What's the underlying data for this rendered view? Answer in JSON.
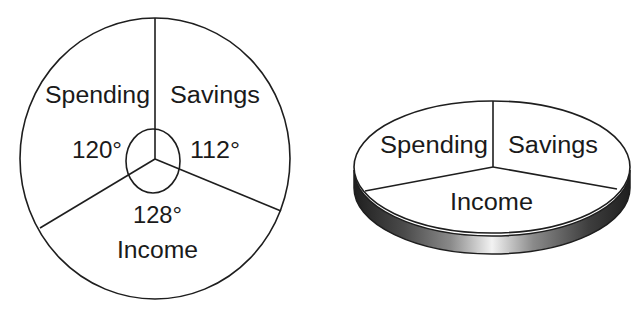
{
  "diagram": {
    "flat_pie": {
      "sectors": [
        {
          "label": "Spending",
          "angle_label": "120°",
          "angle": 120
        },
        {
          "label": "Savings",
          "angle_label": "112°",
          "angle": 112
        },
        {
          "label": "Income",
          "angle_label": "128°",
          "angle": 128
        }
      ]
    },
    "pie_3d": {
      "sectors": [
        {
          "label": "Spending"
        },
        {
          "label": "Savings"
        },
        {
          "label": "Income"
        }
      ]
    },
    "colors": {
      "line": "#1e1e1e",
      "fill": "#ffffff",
      "rim_dark": "#2a2a2a",
      "rim_light": "#f0f0f0"
    }
  }
}
